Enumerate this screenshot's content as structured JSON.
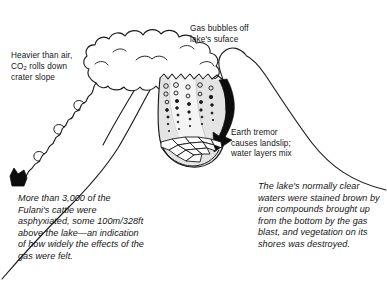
{
  "figure": {
    "title_implicit": "Lake Nyos limnic eruption cross-section diagram",
    "labels": {
      "co2_slope": "Heavier than air,\nCO2 rolls down\ncrater slope",
      "co2_slope_line1": "Heavier than air,",
      "co2_slope_line2_pre": "CO",
      "co2_slope_line2_sub": "2",
      "co2_slope_line2_post": " rolls down",
      "co2_slope_line3": "crater slope",
      "gas_bubbles": "Gas bubbles off\n   lake's suface",
      "earth_tremor": "Earth tremor\ncauses landslip;\nwater layers mix"
    },
    "captions": {
      "left": "More than 3,000 of the Fulani's cattle were asphyxiated, some 100m/328ft above the lake—an indication of how widely the effects of the gas were felt.",
      "right": "The lake's normally clear waters were stained brown by iron compounds brought up from the bottom by the gas blast, and vegetation on its shores was destroyed."
    },
    "elements": [
      {
        "name": "gas-cloud",
        "desc": "billowing gas cloud above crater"
      },
      {
        "name": "crater-lake",
        "desc": "cross-section of lake water"
      },
      {
        "name": "gas-bubble-columns",
        "desc": "columns of rising bubbles"
      },
      {
        "name": "landslip-arrow",
        "desc": "black arrow indicating landslip"
      },
      {
        "name": "lake-bed-rocks",
        "desc": "boulders at lake bottom"
      },
      {
        "name": "co2-flow",
        "desc": "wavy CO2 cloud rolling down left slope"
      },
      {
        "name": "left-slope",
        "desc": "outer left mountain slope"
      },
      {
        "name": "right-slope",
        "desc": "outer right mountain slope"
      },
      {
        "name": "shore-vegetation",
        "desc": "dark vegetation clump at lower left"
      }
    ],
    "colors": {
      "ink": "#1a1a1a",
      "paper": "#ffffff",
      "water": "#e3e3e3",
      "water_light": "#efefef",
      "cloud": "#ffffff"
    }
  }
}
